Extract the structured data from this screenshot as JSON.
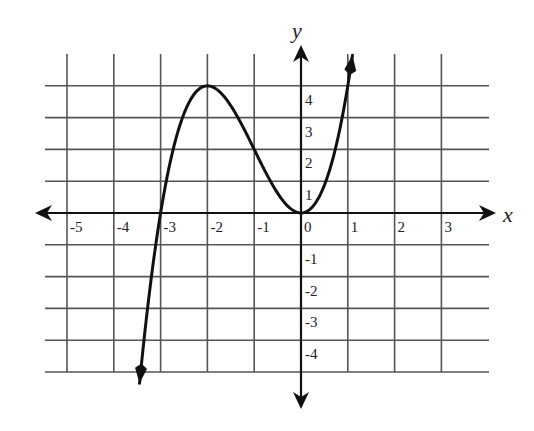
{
  "chart_data": {
    "type": "line",
    "title": "",
    "xlabel": "x",
    "ylabel": "y",
    "xlim": [
      -5,
      3
    ],
    "ylim": [
      -5,
      4
    ],
    "grid": true,
    "x_tick_labels": [
      "-5",
      "-4",
      "-3",
      "-2",
      "-1",
      "0",
      "1",
      "2",
      "3"
    ],
    "y_tick_labels": [
      "4",
      "3",
      "2",
      "1",
      "-1",
      "-2",
      "-3",
      "-4"
    ],
    "series": [
      {
        "name": "f(x)",
        "description": "cubic curve with arrows at both ends; crosses x-axis near -3, local max at (-2, 4), touches x-axis at origin (local min at (0, 0))",
        "x": [
          -3.45,
          -3.25,
          -3,
          -2.75,
          -2.5,
          -2.25,
          -2,
          -1.75,
          -1.5,
          -1.25,
          -1,
          -0.75,
          -0.5,
          -0.25,
          0,
          0.25,
          0.5,
          0.75,
          1,
          1.1
        ],
        "y": [
          -5.35,
          -2.75,
          0,
          1.89,
          3.13,
          3.8,
          4,
          3.83,
          3.38,
          2.73,
          2,
          1.27,
          0.63,
          0.17,
          0,
          0.2,
          0.88,
          2.11,
          4,
          4.96
        ]
      }
    ],
    "key_points": [
      {
        "label": "x-intercept",
        "x": -3,
        "y": 0
      },
      {
        "label": "local maximum",
        "x": -2,
        "y": 4
      },
      {
        "label": "local minimum / x-intercept",
        "x": 0,
        "y": 0
      }
    ]
  },
  "axes": {
    "x_label": "x",
    "y_label": "y",
    "colors": {
      "grid": "#555555",
      "axis": "#111111",
      "curve": "#111111",
      "background": "#ffffff"
    }
  }
}
